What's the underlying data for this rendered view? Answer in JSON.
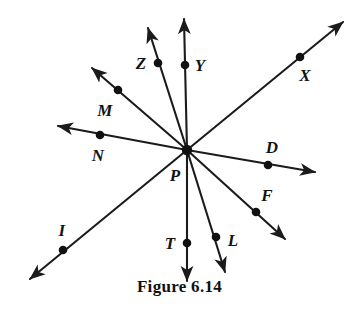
{
  "figure": {
    "caption": "Figure 6.14",
    "vertex": {
      "name": "P",
      "label": "P",
      "x": 187,
      "y": 150,
      "label_x": 175,
      "label_y": 175
    },
    "colors": {
      "stroke": "#1b1b1b",
      "dot": "#111111",
      "text": "#131313",
      "background": "#ffffff"
    },
    "rays": [
      {
        "name": "ray-PZ",
        "label": "Z",
        "point_x": 158,
        "point_y": 63,
        "tip_x": 148,
        "tip_y": 28,
        "label_x": 141,
        "label_y": 63,
        "arrow": true
      },
      {
        "name": "ray-PY",
        "label": "Y",
        "point_x": 185,
        "point_y": 65,
        "tip_x": 184,
        "tip_y": 19,
        "label_x": 200,
        "label_y": 65,
        "arrow": true
      },
      {
        "name": "ray-PX",
        "label": "X",
        "point_x": 300,
        "point_y": 57,
        "tip_x": 343,
        "tip_y": 22,
        "label_x": 305,
        "label_y": 75,
        "arrow": true
      },
      {
        "name": "ray-PM",
        "label": "M",
        "point_x": 118,
        "point_y": 90,
        "tip_x": 92,
        "tip_y": 68,
        "label_x": 105,
        "label_y": 110,
        "arrow": true
      },
      {
        "name": "ray-PN",
        "label": "N",
        "point_x": 100,
        "point_y": 135,
        "tip_x": 58,
        "tip_y": 126,
        "label_x": 98,
        "label_y": 155,
        "arrow": true
      },
      {
        "name": "ray-PD",
        "label": "D",
        "point_x": 268,
        "point_y": 165,
        "tip_x": 315,
        "tip_y": 172,
        "label_x": 272,
        "label_y": 147,
        "arrow": true
      },
      {
        "name": "ray-PF",
        "label": "F",
        "point_x": 256,
        "point_y": 212,
        "tip_x": 285,
        "tip_y": 239,
        "label_x": 267,
        "label_y": 195,
        "arrow": true
      },
      {
        "name": "ray-PL",
        "label": "L",
        "point_x": 216,
        "point_y": 237,
        "tip_x": 225,
        "tip_y": 272,
        "label_x": 233,
        "label_y": 240,
        "arrow": true
      },
      {
        "name": "ray-PT",
        "label": "T",
        "point_x": 187,
        "point_y": 243,
        "tip_x": 187,
        "tip_y": 281,
        "label_x": 170,
        "label_y": 243,
        "arrow": true
      },
      {
        "name": "ray-PI",
        "label": "I",
        "point_x": 63,
        "point_y": 250,
        "tip_x": 30,
        "tip_y": 279,
        "label_x": 62,
        "label_y": 230,
        "arrow": true
      }
    ]
  },
  "chart_data": {
    "type": "diagram",
    "title": "Figure 6.14",
    "vertex": {
      "label": "P",
      "x": 187,
      "y": 150
    },
    "labels": [
      "Z",
      "Y",
      "X",
      "M",
      "N",
      "D",
      "F",
      "L",
      "T",
      "I",
      "P"
    ],
    "points": [
      {
        "label": "Z",
        "x": 158,
        "y": 63
      },
      {
        "label": "Y",
        "x": 185,
        "y": 65
      },
      {
        "label": "X",
        "x": 300,
        "y": 57
      },
      {
        "label": "M",
        "x": 118,
        "y": 90
      },
      {
        "label": "N",
        "x": 100,
        "y": 135
      },
      {
        "label": "D",
        "x": 268,
        "y": 165
      },
      {
        "label": "F",
        "x": 256,
        "y": 212
      },
      {
        "label": "L",
        "x": 216,
        "y": 237
      },
      {
        "label": "T",
        "x": 187,
        "y": 243
      },
      {
        "label": "I",
        "x": 63,
        "y": 250
      }
    ]
  }
}
